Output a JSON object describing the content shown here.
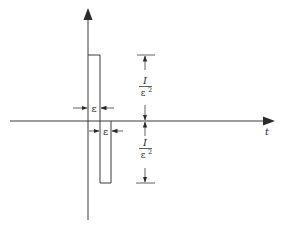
{
  "diagram": {
    "type": "pulse-doublet",
    "colors": {
      "stroke": "#3a3a3a",
      "background": "#ffffff"
    },
    "axes": {
      "horizontal_label": "t",
      "vertical_label": ""
    },
    "pulse_width_label": "ε",
    "pulse_width_label_2": "ε",
    "amplitude_upper": {
      "numerator": "I",
      "denominator": "ε",
      "exponent": "2"
    },
    "amplitude_lower": {
      "numerator": "I",
      "denominator": "ε",
      "exponent": "2"
    }
  }
}
